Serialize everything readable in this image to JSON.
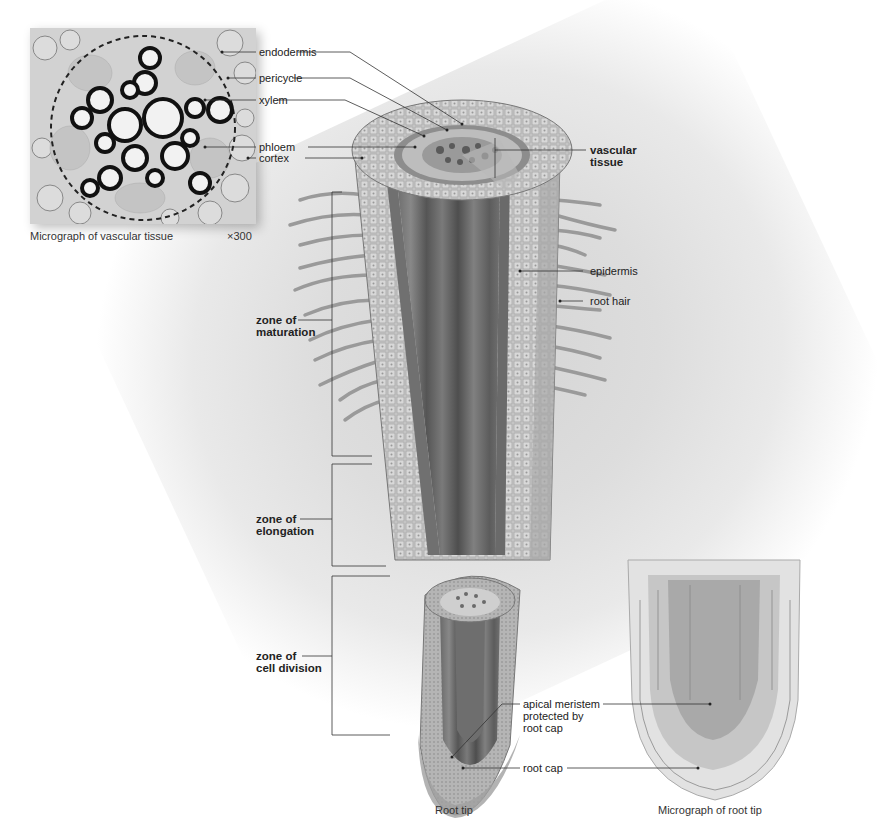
{
  "figure": {
    "type": "labeled biology diagram"
  },
  "micrograph_vascular": {
    "caption": "Micrograph of vascular tissue",
    "magnification": "×300",
    "labels": {
      "endodermis": "endodermis",
      "pericycle": "pericycle",
      "xylem": "xylem",
      "phloem": "phloem",
      "cortex": "cortex"
    }
  },
  "root_diagram": {
    "caption": "Root tip",
    "labels": {
      "vascular_tissue_line1": "vascular",
      "vascular_tissue_line2": "tissue",
      "epidermis": "epidermis",
      "root_hair": "root hair",
      "apical_line1": "apical meristem",
      "apical_line2": "protected by",
      "apical_line3": "root cap",
      "root_cap": "root cap"
    },
    "zones": {
      "maturation_line1": "zone of",
      "maturation_line2": "maturation",
      "elongation_line1": "zone of",
      "elongation_line2": "elongation",
      "division_line1": "zone of",
      "division_line2": "cell division"
    }
  },
  "micrograph_root_tip": {
    "caption": "Micrograph of root tip"
  },
  "colors": {
    "line": "#333333",
    "tissue_light": "#c9c9c9",
    "tissue_mid": "#9a9a9a",
    "tissue_dark": "#5a5a5a",
    "background_shade": "#dcdcdc"
  }
}
